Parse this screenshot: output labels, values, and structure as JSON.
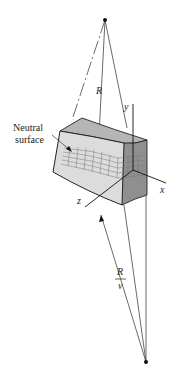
{
  "figure": {
    "labels": {
      "R": "R",
      "y": "y",
      "x": "x",
      "z": "z",
      "neutral_line1": "Neutral",
      "neutral_line2": "surface",
      "ratio_num": "R",
      "ratio_den": "ν"
    },
    "colors": {
      "line": "#333333",
      "block_top": "#b5b5b5",
      "block_front": "#dcdcdc",
      "block_side": "#8f8f8f",
      "grid": "#777777"
    }
  }
}
